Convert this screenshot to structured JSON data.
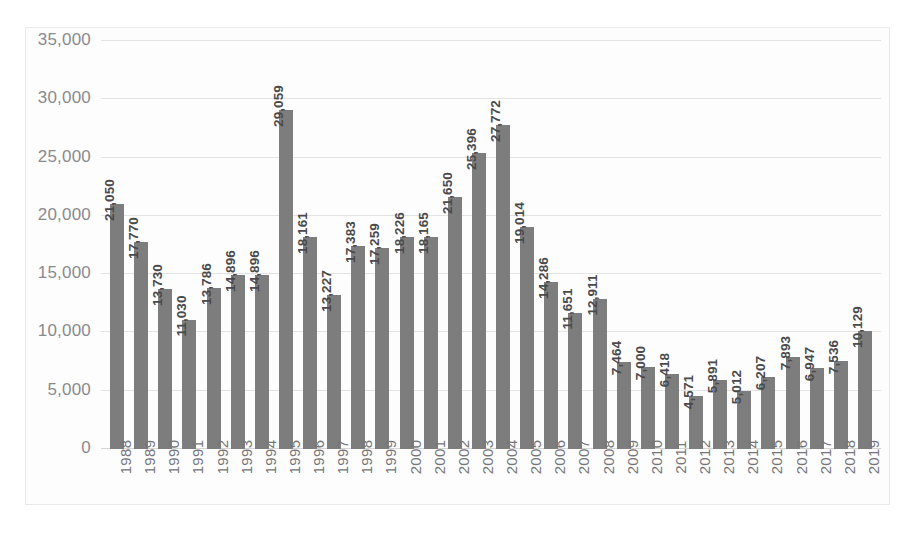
{
  "chart_data": {
    "type": "bar",
    "title": "",
    "subtitle": "",
    "xlabel": "",
    "ylabel": "",
    "ylim": [
      0,
      35000
    ],
    "yticks": [
      "0",
      "5,000",
      "10,000",
      "15,000",
      "20,000",
      "25,000",
      "30,000",
      "35,000"
    ],
    "ytick_values": [
      0,
      5000,
      10000,
      15000,
      20000,
      25000,
      30000,
      35000
    ],
    "grid": true,
    "legend": "none",
    "bar_color": "#7d7d7d",
    "gridline_color": "#e3e3e4",
    "label_color": "#4a4a4c",
    "tick_color": "#8a8a8d",
    "categories": [
      "1988",
      "1989",
      "1990",
      "1991",
      "1992",
      "1993",
      "1994",
      "1995",
      "1996",
      "1997",
      "1998",
      "1999",
      "2000",
      "2001",
      "2002",
      "2003",
      "2004",
      "2005",
      "2006",
      "2007",
      "2008",
      "2009",
      "2010",
      "2011",
      "2012",
      "2013",
      "2014",
      "2015",
      "2016",
      "2017",
      "2018",
      "2019"
    ],
    "values": [
      21050,
      17770,
      13730,
      11030,
      13786,
      14896,
      14896,
      29059,
      18161,
      13227,
      17383,
      17259,
      18226,
      18165,
      21650,
      25396,
      27772,
      19014,
      14286,
      11651,
      12911,
      7464,
      7000,
      6418,
      4571,
      5891,
      5012,
      6207,
      7893,
      6947,
      7536,
      10129
    ],
    "labels": [
      "21,050",
      "17,770",
      "13,730",
      "11,030",
      "13,786",
      "14,896",
      "14,896",
      "29,059",
      "18,161",
      "13,227",
      "17,383",
      "17,259",
      "18,226",
      "18,165",
      "21,650",
      "25,396",
      "27,772",
      "19,014",
      "14,286",
      "11,651",
      "12,911",
      "7,464",
      "7,000",
      "6,418",
      "4,571",
      "5,891",
      "5,012",
      "6,207",
      "7,893",
      "6,947",
      "7,536",
      "10,129"
    ]
  }
}
